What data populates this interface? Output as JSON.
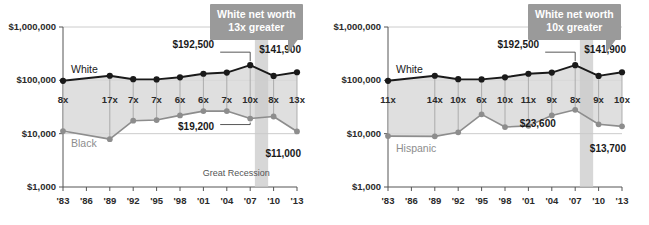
{
  "figure": {
    "y_axis_ticks": [
      "$1,000,000",
      "$100,000",
      "$10,000",
      "$1,000"
    ],
    "y_axis_values": [
      1000000,
      100000,
      10000,
      1000
    ],
    "x_axis_ticks": [
      "'83",
      "'86",
      "'89",
      "'92",
      "'95",
      "'98",
      "'01",
      "'04",
      "'07",
      "'10",
      "'13"
    ],
    "x_axis_values": [
      1983,
      1986,
      1989,
      1992,
      1995,
      1998,
      2001,
      2004,
      2007,
      2010,
      2013
    ],
    "colors": {
      "major_line": "#1a1a1a",
      "minor_line": "#8d8d8d",
      "band_fill": "#d9d9d9",
      "recession_band": "#c9c9c9",
      "callout_bg": "#9a9a9a",
      "axis": "#555555",
      "gridline": "#bfbfbf"
    },
    "recession": {
      "label": "Great Recession",
      "start": 2007.6,
      "end": 2009.3
    }
  },
  "chart_data": [
    {
      "type": "line",
      "title": "White vs. Black median household net worth",
      "xlabel": "",
      "ylabel": "",
      "scale": "log",
      "ylim": [
        1000,
        1000000
      ],
      "xlim": [
        1983,
        2013
      ],
      "grid": true,
      "legend": "inline",
      "x": [
        1983,
        1989,
        1992,
        1995,
        1998,
        2001,
        2004,
        2007,
        2010,
        2013
      ],
      "categories": [
        "1983",
        "1989",
        "1992",
        "1995",
        "1998",
        "2001",
        "2004",
        "2007",
        "2010",
        "2013"
      ],
      "series": [
        {
          "name": "White",
          "style": "major",
          "values": [
            98000,
            122000,
            105000,
            104000,
            114000,
            133000,
            140000,
            192500,
            121000,
            141900
          ]
        },
        {
          "name": "Black",
          "style": "minor",
          "values": [
            11200,
            7900,
            17500,
            18000,
            22000,
            26500,
            26500,
            19200,
            21000,
            11000
          ]
        }
      ],
      "ratio_labels": [
        "8x",
        "17x",
        "7x",
        "7x",
        "6x",
        "6x",
        "7x",
        "10x",
        "8x",
        "13x"
      ],
      "annotations": [
        {
          "name": "white-peak",
          "text": "$192,500",
          "x": 2007,
          "series": 0,
          "anchor": "end",
          "dx": -6,
          "dy": -20,
          "leader": true
        },
        {
          "name": "white-last",
          "text": "$141,900",
          "x": 2013,
          "series": 0,
          "anchor": "end",
          "dx": 6,
          "dy": -22,
          "leader": false
        },
        {
          "name": "black-2007",
          "text": "$19,200",
          "x": 2007,
          "series": 1,
          "anchor": "end",
          "dx": -6,
          "dy": 8,
          "leader": true
        },
        {
          "name": "black-last",
          "text": "$11,000",
          "x": 2013,
          "series": 1,
          "anchor": "end",
          "dx": 6,
          "dy": 23,
          "leader": false
        }
      ],
      "callout": {
        "line1": "White net worth",
        "line2": "13x greater"
      }
    },
    {
      "type": "line",
      "title": "White vs. Hispanic median household net worth",
      "xlabel": "",
      "ylabel": "",
      "scale": "log",
      "ylim": [
        1000,
        1000000
      ],
      "xlim": [
        1983,
        2013
      ],
      "grid": true,
      "legend": "inline",
      "x": [
        1983,
        1989,
        1992,
        1995,
        1998,
        2001,
        2004,
        2007,
        2010,
        2013
      ],
      "categories": [
        "1983",
        "1989",
        "1992",
        "1995",
        "1998",
        "2001",
        "2004",
        "2007",
        "2010",
        "2013"
      ],
      "series": [
        {
          "name": "White",
          "style": "major",
          "values": [
            98000,
            122000,
            105000,
            104000,
            114000,
            133000,
            140000,
            192500,
            121000,
            141900
          ]
        },
        {
          "name": "Hispanic",
          "style": "minor",
          "values": [
            9000,
            8900,
            10600,
            23000,
            13300,
            14000,
            22000,
            28000,
            15000,
            13700
          ]
        }
      ],
      "ratio_labels": [
        "11x",
        "14x",
        "10x",
        "6x",
        "10x",
        "11x",
        "9x",
        "8x",
        "9x",
        "10x"
      ],
      "annotations": [
        {
          "name": "white-peak",
          "text": "$192,500",
          "x": 2007,
          "series": 0,
          "anchor": "end",
          "dx": -6,
          "dy": -20,
          "leader": true
        },
        {
          "name": "white-last",
          "text": "$141,900",
          "x": 2013,
          "series": 0,
          "anchor": "end",
          "dx": 6,
          "dy": -22,
          "leader": false
        },
        {
          "name": "hispanic-2004",
          "text": "$23,600",
          "x": 2004,
          "series": 1,
          "anchor": "end",
          "dx": 24,
          "dy": 9,
          "leader": false
        },
        {
          "name": "hispanic-last",
          "text": "$13,700",
          "x": 2013,
          "series": 1,
          "anchor": "end",
          "dx": 6,
          "dy": 23,
          "leader": false
        }
      ],
      "callout": {
        "line1": "White net worth",
        "line2": "10x greater"
      }
    }
  ]
}
